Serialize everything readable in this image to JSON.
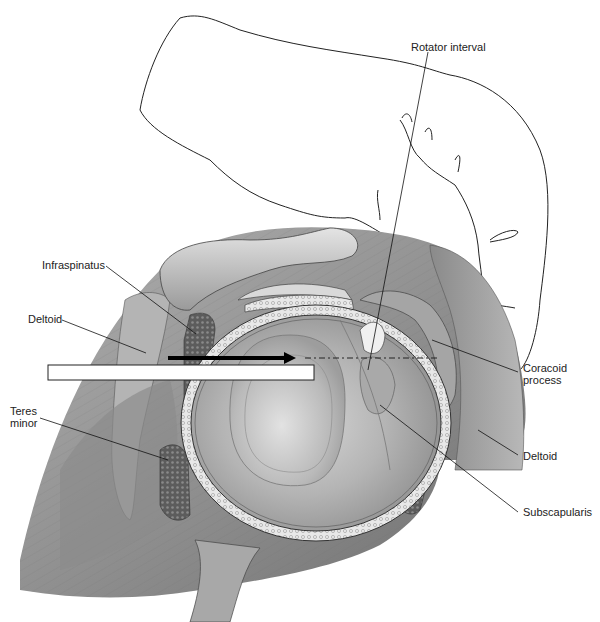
{
  "figure": {
    "labels": [
      {
        "id": "rotator-interval",
        "text": "Rotator interval",
        "x": 411,
        "y": 41
      },
      {
        "id": "infraspinatus",
        "text": "Infraspinatus",
        "x": 42,
        "y": 259
      },
      {
        "id": "deltoid-left",
        "text": "Deltoid",
        "x": 28,
        "y": 313
      },
      {
        "id": "coracoid-process",
        "text": "Coracoid\nprocess",
        "x": 523,
        "y": 362
      },
      {
        "id": "teres-minor",
        "text": "Teres\nminor",
        "x": 10,
        "y": 405
      },
      {
        "id": "deltoid-right",
        "text": "Deltoid",
        "x": 523,
        "y": 450
      },
      {
        "id": "subscapularis",
        "text": "Subscapularis",
        "x": 523,
        "y": 506
      }
    ],
    "colors": {
      "background": "#ffffff",
      "muscle_dark": "#7a7a7a",
      "muscle_mid": "#9c9c9c",
      "muscle_light": "#c4c4c4",
      "cartilage": "#b8b8b8",
      "labrum": "#e6e6e6",
      "ink": "#111111",
      "arrow": "#000000",
      "instrument": "#ffffff"
    }
  }
}
